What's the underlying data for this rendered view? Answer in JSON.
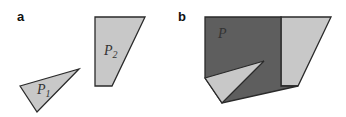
{
  "panels": [
    {
      "label": "a",
      "shapes": [
        {
          "name": "P",
          "subscript": "1",
          "type": "triangle",
          "fill": "#c8c8c8"
        },
        {
          "name": "P",
          "subscript": "2",
          "type": "quadrilateral",
          "fill": "#c8c8c8"
        }
      ]
    },
    {
      "label": "b",
      "shapes": [
        {
          "name": "P",
          "subscript": "",
          "type": "polygon",
          "fill": "#5e5e5e"
        },
        {
          "name": "",
          "subscript": "",
          "type": "quadrilateral",
          "fill": "#c8c8c8"
        },
        {
          "name": "",
          "subscript": "",
          "type": "triangle",
          "fill": "#c8c8c8"
        }
      ]
    }
  ],
  "colors": {
    "light": "#c8c8c8",
    "dark": "#5e5e5e",
    "stroke": "#2a2a2a"
  }
}
